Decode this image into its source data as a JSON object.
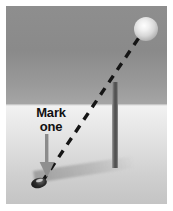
{
  "figure": {
    "title": "Mark one",
    "caption_lines": [
      "Mark",
      "one"
    ],
    "scene": {
      "sky_color": "#8a8a8a",
      "ground_color": "#cfcfcf",
      "horizon_y": 99
    },
    "elements": {
      "sphere": {
        "name": "glowing-ball",
        "color": "#f0f0f0",
        "center_x": 140,
        "center_y": 23,
        "radius": 12
      },
      "pole": {
        "name": "vertical-post",
        "color": "#4d4d4d",
        "x": 106,
        "top_y": 76,
        "height": 86
      },
      "trajectory": {
        "name": "dashed-flight-path",
        "color": "#1a1a1a",
        "style": "dashed",
        "from_x": 36,
        "from_y": 176,
        "to_x": 134,
        "to_y": 30
      },
      "ground_ball": {
        "name": "marked-object",
        "color": "#111111",
        "x": 25,
        "y": 172
      },
      "arrow": {
        "name": "down-pointer",
        "color": "#8f8f8f",
        "direction": "down",
        "x": 33,
        "y": 128
      },
      "shadow": {
        "name": "ground-shadow",
        "color": "#9a9a9a"
      }
    }
  }
}
